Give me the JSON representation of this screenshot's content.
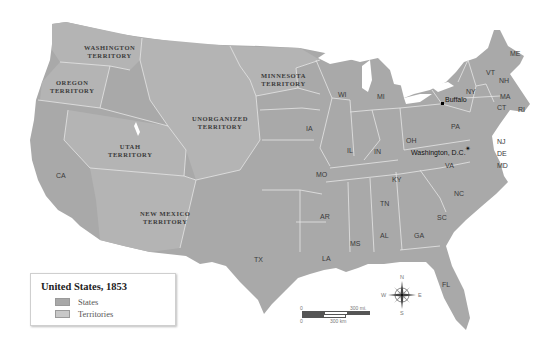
{
  "map": {
    "title": "United States, 1853",
    "legend": {
      "title": "United States, 1853",
      "items": [
        {
          "label": "States",
          "color": "#a2a2a2"
        },
        {
          "label": "Territories",
          "color": "#c6c6c6"
        }
      ]
    },
    "territories": [
      {
        "name": "Washington Territory",
        "line1": "Washington",
        "line2": "Territory"
      },
      {
        "name": "Oregon Territory",
        "line1": "Oregon",
        "line2": "Territory"
      },
      {
        "name": "Minnesota Territory",
        "line1": "Minnesota",
        "line2": "Territory"
      },
      {
        "name": "Unorganized Territory",
        "line1": "Unorganized",
        "line2": "Territory"
      },
      {
        "name": "Utah Territory",
        "line1": "Utah",
        "line2": "Territory"
      },
      {
        "name": "New Mexico Territory",
        "line1": "New Mexico",
        "line2": "Territory"
      }
    ],
    "states": [
      "CA",
      "TX",
      "IA",
      "MO",
      "AR",
      "LA",
      "WI",
      "MI",
      "IL",
      "IN",
      "OH",
      "KY",
      "TN",
      "MS",
      "AL",
      "GA",
      "FL",
      "SC",
      "NC",
      "VA",
      "PA",
      "NY",
      "VT",
      "NH",
      "ME",
      "MA",
      "CT",
      "RI",
      "NJ",
      "DE",
      "MD"
    ],
    "cities": [
      {
        "name": "Buffalo",
        "marker": "dot"
      },
      {
        "name": "Washington, D.C.",
        "marker": "star"
      }
    ],
    "scale": {
      "miles_zero": "0",
      "miles_label": "300 mi.",
      "km_zero": "0",
      "km_label": "300 km"
    },
    "compass": {
      "n": "N",
      "s": "S",
      "e": "E",
      "w": "W"
    }
  }
}
